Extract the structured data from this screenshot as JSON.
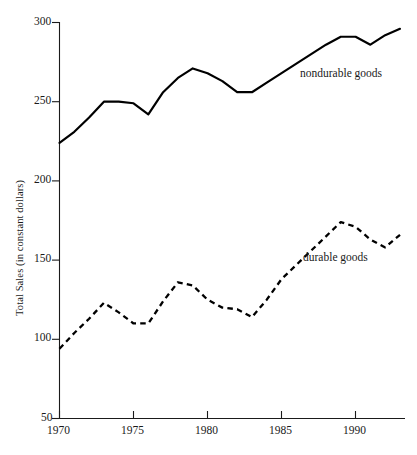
{
  "chart_data": {
    "type": "line",
    "title": "",
    "xlabel": "",
    "ylabel": "Total Sales (in constant dollars)",
    "xlim": [
      1970,
      1993
    ],
    "ylim": [
      50,
      300
    ],
    "xticks": [
      1970,
      1975,
      1980,
      1985,
      1990
    ],
    "yticks": [
      50,
      100,
      150,
      200,
      250,
      300
    ],
    "grid": false,
    "legend_position": "inline-annotation",
    "x": [
      1970,
      1971,
      1972,
      1973,
      1974,
      1975,
      1976,
      1977,
      1978,
      1979,
      1980,
      1981,
      1982,
      1983,
      1984,
      1985,
      1986,
      1987,
      1988,
      1989,
      1990,
      1991,
      1992,
      1993
    ],
    "series": [
      {
        "name": "nondurable goods",
        "style": "solid",
        "color": "#000000",
        "values": [
          224,
          231,
          240,
          250,
          250,
          249,
          242,
          256,
          265,
          271,
          268,
          263,
          256,
          256,
          262,
          268,
          274,
          280,
          286,
          291,
          291,
          286,
          292,
          296
        ]
      },
      {
        "name": "durable goods",
        "style": "dashed",
        "color": "#000000",
        "values": [
          94,
          104,
          113,
          123,
          117,
          110,
          110,
          124,
          136,
          134,
          125,
          120,
          119,
          114,
          125,
          138,
          147,
          156,
          165,
          174,
          171,
          163,
          158,
          166
        ]
      }
    ],
    "annotations": [
      {
        "text": "nondurable goods",
        "x": 1986,
        "y": 274
      },
      {
        "text": "durable goods",
        "x": 1986,
        "y": 146
      }
    ]
  },
  "axis": {
    "y_title": "Total Sales (in constant dollars)",
    "y_tick_labels": [
      "300",
      "250",
      "200",
      "150",
      "100",
      "50"
    ],
    "x_tick_labels": [
      "1970",
      "1975",
      "1980",
      "1985",
      "1990"
    ]
  },
  "labels": {
    "nondurable": "nondurable goods",
    "durable": "durable goods"
  },
  "faint_header": ""
}
